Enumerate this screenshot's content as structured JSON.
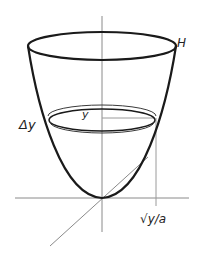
{
  "diagram": {
    "type": "paraboloid-volume-slice",
    "labels": {
      "height": "H",
      "delta_y": "Δy",
      "y": "y",
      "radius": "√y/a"
    },
    "colors": {
      "curve": "#1a1a1a",
      "axis": "#8a8a8a",
      "guide": "#9a9a9a",
      "text": "#222222",
      "background": "#ffffff"
    }
  }
}
